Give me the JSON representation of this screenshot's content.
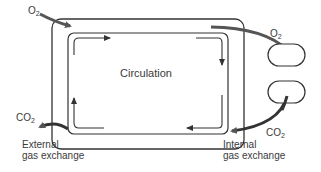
{
  "diagram": {
    "center_label": "Circulation",
    "o2_left": {
      "base": "O",
      "sub": "2"
    },
    "o2_right": {
      "base": "O",
      "sub": "2"
    },
    "co2_left": {
      "base": "CO",
      "sub": "2"
    },
    "co2_right": {
      "base": "CO",
      "sub": "2"
    },
    "external_label_line1": "External",
    "external_label_line2": "gas exchange",
    "internal_label_line1": "Internal",
    "internal_label_line2": "gas exchange",
    "colors": {
      "frame": "#333333",
      "gas_arrow": "#555555",
      "text": "#3a3a3a"
    }
  }
}
